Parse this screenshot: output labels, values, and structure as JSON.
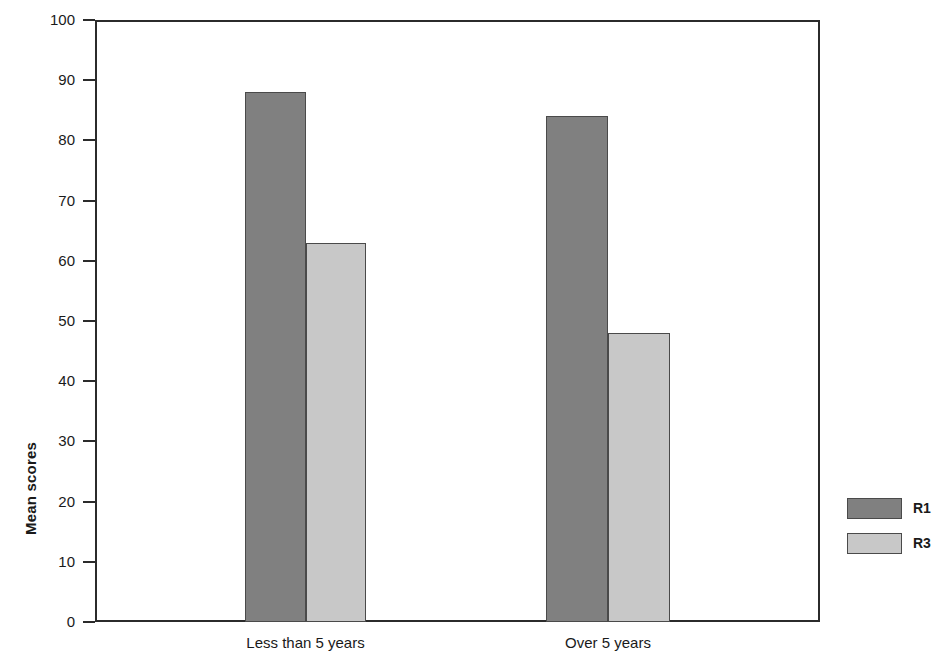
{
  "chart_data": {
    "type": "bar",
    "title": "",
    "subtitle": "",
    "xlabel": "",
    "ylabel": "Mean scores",
    "categories": [
      "Less than 5 years",
      "Over 5 years"
    ],
    "series": [
      {
        "name": "R1",
        "values": [
          88,
          84
        ],
        "color": "#808080"
      },
      {
        "name": "R3",
        "values": [
          63,
          48
        ],
        "color": "#c8c8c8"
      }
    ],
    "ylim": [
      0,
      100
    ],
    "ytick_step": 10,
    "yticks": [
      100,
      90,
      80,
      70,
      60,
      50,
      40,
      30,
      20,
      10,
      0
    ],
    "ytick_labels": [
      "100",
      "90",
      "80",
      "70",
      "60",
      "50",
      "40",
      "30",
      "20",
      "10",
      "0"
    ],
    "grid": false,
    "legend_position": "right-outside",
    "frame": true,
    "bar_border_color": "#4a4a4a",
    "axis_color": "#2b2b2b",
    "annotations": []
  },
  "legend": {
    "entries": [
      {
        "label": "R1",
        "color": "#808080"
      },
      {
        "label": "R3",
        "color": "#c8c8c8"
      }
    ]
  },
  "axes": {
    "y_title": "Mean scores"
  }
}
